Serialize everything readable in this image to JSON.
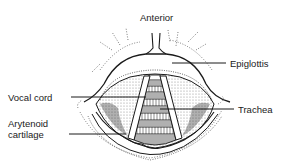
{
  "diagram": {
    "orientation_label": "Anterior",
    "labels": {
      "anterior": "Anterior",
      "epiglottis": "Epiglottis",
      "vocal_cord": "Vocal cord",
      "trachea": "Trachea",
      "arytenoid_line1": "Arytenoid",
      "arytenoid_line2": "cartilage"
    },
    "colors": {
      "ink": "#1a1a1a",
      "background": "#ffffff",
      "stipple": "#555555"
    }
  }
}
